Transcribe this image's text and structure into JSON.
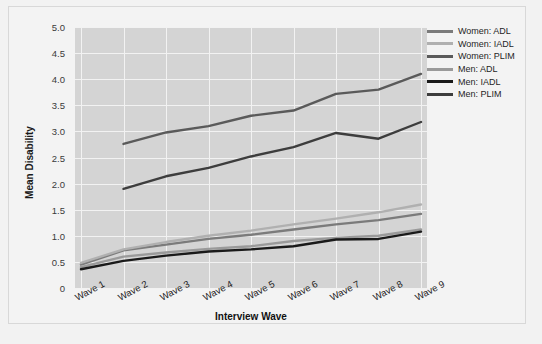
{
  "chart_data": {
    "type": "line",
    "title": "",
    "xlabel": "Interview Wave",
    "ylabel": "Mean Disability",
    "categories": [
      "Wave 1",
      "Wave 2",
      "Wave 3",
      "Wave 4",
      "Wave 5",
      "Wave 6",
      "Wave 7",
      "Wave 8",
      "Wave 9"
    ],
    "ylim": [
      0,
      5.0
    ],
    "yticks": [
      "0",
      "0.5",
      "1.0",
      "1.5",
      "2.0",
      "2.5",
      "3.0",
      "3.5",
      "4.0",
      "4.5",
      "5.0"
    ],
    "ytick_values": [
      0,
      0.5,
      1.0,
      1.5,
      2.0,
      2.5,
      3.0,
      3.5,
      4.0,
      4.5,
      5.0
    ],
    "grid": true,
    "legend_position": "right",
    "series": [
      {
        "name": "Women: ADL",
        "color": "#7b7b7b",
        "values": [
          0.45,
          0.72,
          0.83,
          0.94,
          1.02,
          1.12,
          1.22,
          1.3,
          1.42
        ]
      },
      {
        "name": "Women: IADL",
        "color": "#b0b0b0",
        "values": [
          0.48,
          0.74,
          0.88,
          1.0,
          1.1,
          1.22,
          1.33,
          1.45,
          1.6
        ]
      },
      {
        "name": "Women: PLIM",
        "color": "#5a5a5a",
        "values": [
          null,
          2.76,
          2.98,
          3.1,
          3.3,
          3.4,
          3.72,
          3.8,
          4.1
        ]
      },
      {
        "name": "Men: ADL",
        "color": "#9a9a9a",
        "values": [
          0.4,
          0.6,
          0.68,
          0.75,
          0.8,
          0.9,
          0.96,
          1.0,
          1.12
        ]
      },
      {
        "name": "Men: IADL",
        "color": "#1a1a1a",
        "values": [
          0.36,
          0.52,
          0.62,
          0.7,
          0.74,
          0.8,
          0.93,
          0.94,
          1.08
        ]
      },
      {
        "name": "Men: PLIM",
        "color": "#3d3d3d",
        "values": [
          null,
          1.9,
          2.14,
          2.3,
          2.52,
          2.7,
          2.97,
          2.86,
          3.18
        ]
      }
    ]
  },
  "legend": {
    "items": [
      {
        "label": "Women: ADL"
      },
      {
        "label": "Women: IADL"
      },
      {
        "label": "Women: PLIM"
      },
      {
        "label": "Men: ADL"
      },
      {
        "label": "Men: IADL"
      },
      {
        "label": "Men: PLIM"
      }
    ]
  },
  "colors": {
    "figure_background": "#f3f3f3",
    "panel_background": "#d4d4d4",
    "gridline": "#f2f2f2",
    "text": "#222222"
  }
}
